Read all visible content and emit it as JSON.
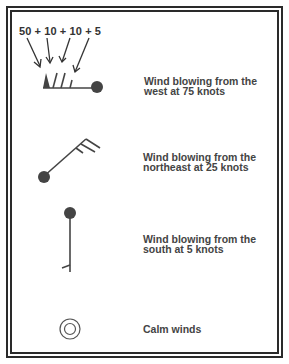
{
  "diagram": {
    "formula": "50 + 10 + 10 + 5",
    "colors": {
      "ink": "#444444",
      "frame": "#2a2a2a",
      "background": "#ffffff"
    },
    "items": [
      {
        "symbol": "wind-barb-west-75",
        "label_line1": "Wind blowing from the",
        "label_line2": "west at 75 knots"
      },
      {
        "symbol": "wind-barb-northeast-25",
        "label_line1": "Wind blowing from the",
        "label_line2": "northeast at 25 knots"
      },
      {
        "symbol": "wind-barb-south-5",
        "label_line1": "Wind blowing from the",
        "label_line2": "south at 5 knots"
      },
      {
        "symbol": "calm-circle",
        "label_line1": "Calm winds"
      }
    ]
  }
}
